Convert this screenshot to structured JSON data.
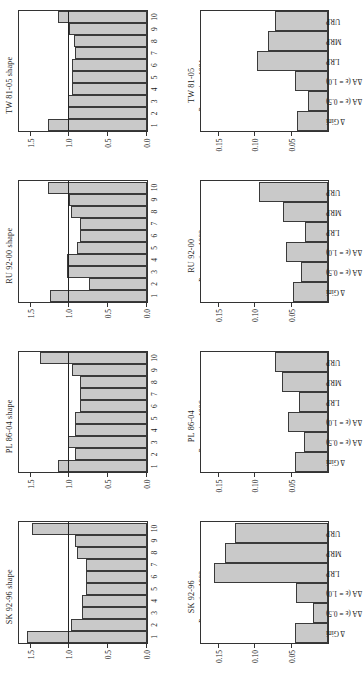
{
  "figure": {
    "left_column_axis": {
      "ylabel": "Relative density",
      "yticks": [
        "0.0",
        "0.5",
        "1.0",
        "1.5"
      ],
      "ytickvals": [
        0.0,
        0.5,
        1.0,
        1.5
      ],
      "ylim": [
        0.0,
        1.65
      ],
      "xcategories": [
        "1",
        "2",
        "3",
        "4",
        "5",
        "6",
        "7",
        "8",
        "9",
        "10"
      ],
      "reference_value": 1.0
    },
    "right_column_axis": {
      "yticks": [
        "0.05",
        "0.10",
        "0.15"
      ],
      "ytickvals": [
        0.05,
        0.1,
        0.15
      ],
      "ylim": [
        0.0,
        0.175
      ],
      "xcategories": [
        "Δ Gini",
        "ΔA (ε = 0.5)",
        "ΔA (ε = 1.0)",
        "LRP",
        "MRP",
        "URP"
      ]
    }
  },
  "chart_data": [
    {
      "id": "tw-shape",
      "type": "bar",
      "title": "TW 81-05 shape",
      "xlabel": "Proportion 1981",
      "ylabel": "",
      "categories": [
        "1",
        "2",
        "3",
        "4",
        "5",
        "6",
        "7",
        "8",
        "9",
        "10"
      ],
      "values": [
        1.27,
        1.02,
        1.02,
        0.97,
        0.97,
        0.97,
        0.92,
        0.94,
        1.0,
        1.14
      ],
      "ylim": [
        0.0,
        1.65
      ],
      "reference_line": 1.0,
      "grid": false
    },
    {
      "id": "tw-measures",
      "type": "bar",
      "title": "TW 81-05",
      "xlabel": "",
      "ylabel": "",
      "categories": [
        "Δ Gini",
        "ΔA (ε = 0.5)",
        "ΔA (ε = 1.0)",
        "LRP",
        "MRP",
        "URP"
      ],
      "values": [
        0.042,
        0.027,
        0.045,
        0.097,
        0.083,
        0.073
      ],
      "ylim": [
        0.0,
        0.175
      ],
      "grid": false
    },
    {
      "id": "ru-shape",
      "type": "bar",
      "title": "RU 92-00 shape",
      "xlabel": "Proportion 1992",
      "ylabel": "",
      "categories": [
        "1",
        "2",
        "3",
        "4",
        "5",
        "6",
        "7",
        "8",
        "9",
        "10"
      ],
      "values": [
        1.25,
        0.75,
        1.03,
        1.03,
        0.9,
        0.86,
        0.86,
        0.98,
        1.0,
        1.27
      ],
      "ylim": [
        0.0,
        1.65
      ],
      "reference_line": 1.0,
      "grid": false
    },
    {
      "id": "ru-measures",
      "type": "bar",
      "title": "RU 92-00",
      "xlabel": "",
      "ylabel": "",
      "categories": [
        "Δ Gini",
        "ΔA (ε = 0.5)",
        "ΔA (ε = 1.0)",
        "LRP",
        "MRP",
        "URP"
      ],
      "values": [
        0.048,
        0.037,
        0.058,
        0.032,
        0.062,
        0.095
      ],
      "ylim": [
        0.0,
        0.175
      ],
      "grid": false
    },
    {
      "id": "pl-shape",
      "type": "bar",
      "title": "PL 86-04 shape",
      "xlabel": "Proportion 1996",
      "ylabel": "",
      "categories": [
        "1",
        "2",
        "3",
        "4",
        "5",
        "6",
        "7",
        "8",
        "9",
        "10"
      ],
      "values": [
        1.15,
        0.93,
        1.02,
        0.93,
        0.93,
        0.86,
        0.86,
        0.86,
        0.97,
        1.38
      ],
      "ylim": [
        0.0,
        1.65
      ],
      "reference_line": 1.0,
      "grid": false
    },
    {
      "id": "pl-measures",
      "type": "bar",
      "title": "PL 86-04",
      "xlabel": "",
      "ylabel": "",
      "categories": [
        "Δ Gini",
        "ΔA (ε = 0.5)",
        "ΔA (ε = 1.0)",
        "LRP",
        "MRP",
        "URP"
      ],
      "values": [
        0.046,
        0.033,
        0.055,
        0.04,
        0.063,
        0.073
      ],
      "ylim": [
        0.0,
        0.175
      ],
      "grid": false
    },
    {
      "id": "sk-shape",
      "type": "bar",
      "title": "SK 92-96 shape",
      "xlabel": "Proportion 1992",
      "ylabel": "Relative density",
      "categories": [
        "1",
        "2",
        "3",
        "4",
        "5",
        "6",
        "7",
        "8",
        "9",
        "10"
      ],
      "values": [
        1.55,
        0.98,
        0.84,
        0.84,
        0.78,
        0.78,
        0.78,
        0.9,
        0.92,
        1.48
      ],
      "ylim": [
        0.0,
        1.65
      ],
      "reference_line": 1.0,
      "grid": false
    },
    {
      "id": "sk-measures",
      "type": "bar",
      "title": "SK 92-96",
      "xlabel": "",
      "ylabel": "",
      "categories": [
        "Δ Gini",
        "ΔA (ε = 0.5)",
        "ΔA (ε = 1.0)",
        "LRP",
        "MRP",
        "URP"
      ],
      "values": [
        0.045,
        0.021,
        0.044,
        0.157,
        0.142,
        0.127
      ],
      "ylim": [
        0.0,
        0.175
      ],
      "grid": false
    }
  ],
  "style": {
    "bar_fill": "#c9c9c9",
    "bar_stroke": "#3a3a3a",
    "axis_color": "#333333",
    "reference_line_color": "#222222",
    "background": "#ffffff"
  }
}
